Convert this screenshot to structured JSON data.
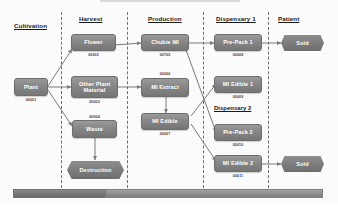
{
  "diagram": {
    "columns": [
      {
        "key": "cultivation",
        "label": "Cultivation"
      },
      {
        "key": "harvest",
        "label": "Harvest"
      },
      {
        "key": "production",
        "label": "Production"
      },
      {
        "key": "dispensary1",
        "label": "Dispensary 1"
      },
      {
        "key": "patient",
        "label": "Patient"
      }
    ],
    "sub_headers": [
      {
        "key": "dispensary2",
        "label": "Dispensary 2"
      }
    ],
    "nodes": [
      {
        "key": "plant",
        "label": "Plant",
        "id": "00001",
        "shape": "rect"
      },
      {
        "key": "flower",
        "label": "Flower",
        "id": "00002",
        "shape": "rect"
      },
      {
        "key": "other_plant",
        "label": "Other Plant Material",
        "id": "00003",
        "shape": "rect"
      },
      {
        "key": "waste",
        "label": "Waste",
        "id": "00004",
        "shape": "rect"
      },
      {
        "key": "destruction",
        "label": "Destruction",
        "id": "",
        "shape": "hex"
      },
      {
        "key": "chubie_mi",
        "label": "Chubie MI",
        "id": "00705",
        "shape": "rect"
      },
      {
        "key": "mi_extract",
        "label": "MI Extract",
        "id": "00006",
        "shape": "rect"
      },
      {
        "key": "mi_edible",
        "label": "MI Edible",
        "id": "00007",
        "shape": "rect"
      },
      {
        "key": "pre_pack_1",
        "label": "Pre-Pack 1",
        "id": "00008",
        "shape": "rect"
      },
      {
        "key": "mi_edible_1",
        "label": "MI Edible 1",
        "id": "00009",
        "shape": "rect"
      },
      {
        "key": "pre_pack_2",
        "label": "Pre-Pack 2",
        "id": "00010",
        "shape": "rect"
      },
      {
        "key": "mi_edible_2",
        "label": "MI Edible 2",
        "id": "00011",
        "shape": "rect"
      },
      {
        "key": "sold_top",
        "label": "Sold",
        "id": "",
        "shape": "hex"
      },
      {
        "key": "sold_bottom",
        "label": "Sold",
        "id": "",
        "shape": "hex"
      }
    ],
    "edges": [
      {
        "from": "plant",
        "to": "flower"
      },
      {
        "from": "plant",
        "to": "other_plant"
      },
      {
        "from": "plant",
        "to": "waste"
      },
      {
        "from": "flower",
        "to": "chubie_mi"
      },
      {
        "from": "other_plant",
        "to": "mi_extract"
      },
      {
        "from": "waste",
        "to": "destruction"
      },
      {
        "from": "mi_extract",
        "to": "mi_edible"
      },
      {
        "from": "chubie_mi",
        "to": "pre_pack_1"
      },
      {
        "from": "chubie_mi",
        "to": "pre_pack_2"
      },
      {
        "from": "mi_edible",
        "to": "mi_edible_1"
      },
      {
        "from": "mi_edible",
        "to": "mi_edible_2"
      },
      {
        "from": "pre_pack_1",
        "to": "sold_top"
      },
      {
        "from": "mi_edible_2",
        "to": "sold_bottom"
      }
    ],
    "colors": {
      "node_fill": "#868686",
      "node_text": "#ffffff",
      "divider": "#6f6f6f",
      "connector": "#7a7a7a",
      "timeline_bar": "#8d8d8d",
      "timeline_fill": "#777777",
      "header_text": "#1b1b1b"
    },
    "timeline": {
      "label": "",
      "fill_percent": 30
    }
  }
}
